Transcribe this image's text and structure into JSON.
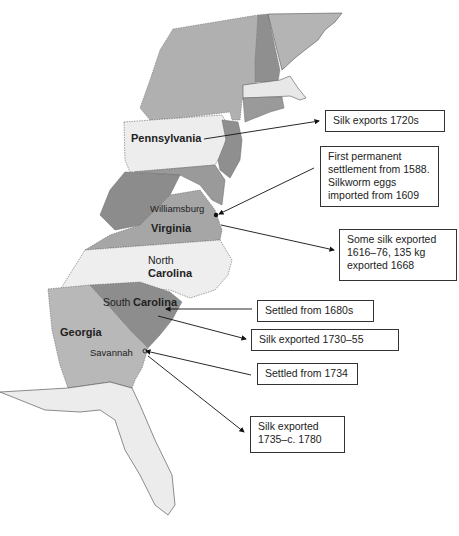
{
  "figure": {
    "type": "historical map",
    "region": "Eastern seaboard of North America (British colonies)"
  },
  "colors": {
    "dark_gray": "#8f8f8f",
    "mid_gray": "#a9a9a9",
    "light_gray": "#bcbcbc",
    "pale": "#ececec",
    "outline": "#333333"
  },
  "map_labels": {
    "pennsylvania": "Pennsylvania",
    "williamsburg": "Williamsburg",
    "virginia": "Virginia",
    "north": "North",
    "carolina_nc": "Carolina",
    "south": "South",
    "carolina_sc": "Carolina",
    "georgia": "Georgia",
    "savannah": "Savannah"
  },
  "callouts": [
    {
      "id": "pa-silk",
      "lines": [
        "Silk exports 1720s"
      ]
    },
    {
      "id": "va-settlement",
      "lines": [
        "First permanent",
        "settlement from 1588.",
        "Silkworm eggs",
        "imported from 1609"
      ]
    },
    {
      "id": "va-silk",
      "lines": [
        "Some silk exported",
        "1616–76, 135 kg",
        "exported 1668"
      ]
    },
    {
      "id": "sc-settled",
      "lines": [
        "Settled from 1680s"
      ]
    },
    {
      "id": "sc-silk",
      "lines": [
        "Silk exported 1730–55"
      ]
    },
    {
      "id": "ga-settled",
      "lines": [
        "Settled from 1734"
      ]
    },
    {
      "id": "ga-silk",
      "lines": [
        "Silk exported",
        "1735–c. 1780"
      ]
    }
  ]
}
